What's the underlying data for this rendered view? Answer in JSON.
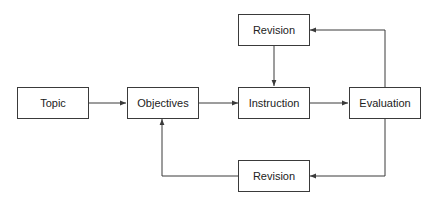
{
  "diagram": {
    "nodes": [
      {
        "id": "topic",
        "label": "Topic"
      },
      {
        "id": "objectives",
        "label": "Objectives"
      },
      {
        "id": "instruction",
        "label": "Instruction"
      },
      {
        "id": "evaluation",
        "label": "Evaluation"
      },
      {
        "id": "revision_top",
        "label": "Revision"
      },
      {
        "id": "revision_bottom",
        "label": "Revision"
      }
    ],
    "edges": [
      {
        "from": "topic",
        "to": "objectives"
      },
      {
        "from": "objectives",
        "to": "instruction"
      },
      {
        "from": "instruction",
        "to": "evaluation"
      },
      {
        "from": "evaluation",
        "to": "revision_top"
      },
      {
        "from": "revision_top",
        "to": "instruction"
      },
      {
        "from": "evaluation",
        "to": "revision_bottom"
      },
      {
        "from": "revision_bottom",
        "to": "objectives"
      }
    ],
    "colors": {
      "stroke": "#3a3a3a",
      "background": "#ffffff",
      "text": "#222222"
    }
  }
}
